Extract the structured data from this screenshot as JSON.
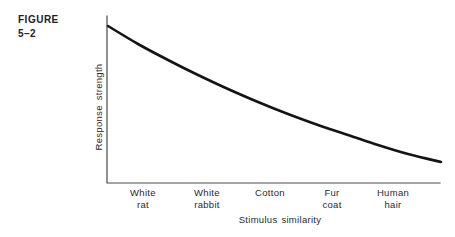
{
  "figure": {
    "label_word": "FIGURE",
    "label_number": "5–2"
  },
  "colors": {
    "background": "#ffffff",
    "text": "#2a2a2a",
    "axis": "#4a4a4a",
    "curve": "#141414"
  },
  "chart_data": {
    "type": "line",
    "title": "",
    "xlabel": "Stimulus similarity",
    "ylabel": "Response strength",
    "categories": [
      "White rat",
      "White rabbit",
      "Cotton",
      "Fur coat",
      "Human hair"
    ],
    "values": [
      0.87,
      0.66,
      0.48,
      0.34,
      0.22
    ],
    "value_note": "relative response strength, unlabeled axis, curve decays smoothly from 1.0 at y-axis to 0.13 at right edge",
    "ylim": [
      0,
      1
    ],
    "grid": false,
    "legend_position": "none",
    "axis_numeric_ticks_visible": false,
    "x_ticks": [
      {
        "line1": "White",
        "line2": "rat",
        "x_px": 143
      },
      {
        "line1": "White",
        "line2": "rabbit",
        "x_px": 207
      },
      {
        "line1": "Cotton",
        "line2": "",
        "x_px": 270
      },
      {
        "line1": "Fur",
        "line2": "coat",
        "x_px": 332
      },
      {
        "line1": "Human",
        "line2": "hair",
        "x_px": 393
      }
    ],
    "axes_px": {
      "x_start": 107,
      "x_end": 440,
      "y_top": 16,
      "y_bottom": 183
    },
    "curve_px": [
      [
        108,
        26
      ],
      [
        138,
        44
      ],
      [
        168,
        60
      ],
      [
        198,
        75
      ],
      [
        228,
        89
      ],
      [
        258,
        102
      ],
      [
        288,
        114
      ],
      [
        318,
        125
      ],
      [
        348,
        135
      ],
      [
        378,
        145
      ],
      [
        408,
        154
      ],
      [
        441,
        162
      ]
    ]
  }
}
